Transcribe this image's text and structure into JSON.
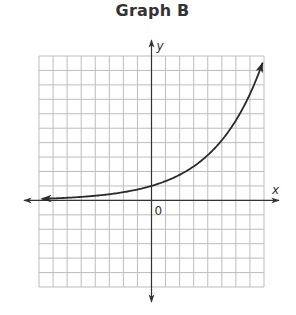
{
  "title": "Graph B",
  "chart_data": {
    "type": "line",
    "title": "Graph B",
    "xlabel": "x",
    "ylabel": "y",
    "origin_label": "0",
    "xlim": [
      -8,
      8
    ],
    "ylim": [
      -6,
      10
    ],
    "grid": true,
    "grid_step": 1,
    "legend": null,
    "series": [
      {
        "name": "exponential growth",
        "description": "Increasing exponential curve, approaches x-axis on the left, passes through (0, 1), arrow at both ends",
        "x": [
          -8,
          -6,
          -4,
          -2,
          0,
          2,
          4,
          5,
          6,
          7,
          8
        ],
        "y": [
          0.1,
          0.18,
          0.32,
          0.57,
          1,
          1.77,
          3.13,
          4.16,
          5.53,
          7.36,
          9.8
        ]
      }
    ]
  },
  "colors": {
    "grid": "#bdbdbd",
    "axis": "#333333",
    "curve": "#2b2b2b",
    "title": "#333333"
  }
}
